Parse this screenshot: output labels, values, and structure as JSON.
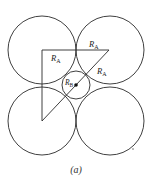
{
  "figure": {
    "caption": "(a)",
    "stroke_color": "#2a2a2a",
    "background": "#ffffff",
    "large_circles": [
      {
        "name": "top-left",
        "cx": 42,
        "cy": 50,
        "r": 34
      },
      {
        "name": "top-right",
        "cx": 110,
        "cy": 50,
        "r": 34
      },
      {
        "name": "bottom-left",
        "cx": 42,
        "cy": 121,
        "r": 34
      },
      {
        "name": "bottom-right",
        "cx": 110,
        "cy": 121,
        "r": 34
      }
    ],
    "small_circle": {
      "cx": 76,
      "cy": 85,
      "r": 14
    },
    "triangle": {
      "points": "42,50 109,50 42,121"
    },
    "labels": [
      {
        "id": "ra-left",
        "main": "R",
        "sub": "A",
        "x": 51,
        "y": 61
      },
      {
        "id": "ra-top",
        "main": "R",
        "sub": "A",
        "x": 89,
        "y": 47
      },
      {
        "id": "ra-diag",
        "main": "R",
        "sub": "A",
        "x": 97,
        "y": 74
      },
      {
        "id": "rb",
        "main": "R",
        "sub": "B",
        "x": 65,
        "y": 85
      }
    ]
  }
}
